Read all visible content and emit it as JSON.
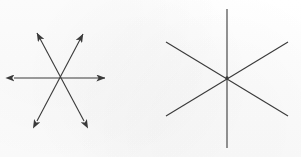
{
  "figure": {
    "background_color": "#fdfdfd",
    "stroke_color": "#3a3a3a",
    "canvas": {
      "width": 301,
      "height": 157
    },
    "panels": [
      {
        "id": "left-panel",
        "name": "vector-star-diagram",
        "description": "Six double-headed arrows radiating from a common center",
        "center": {
          "x": 60,
          "y": 78
        },
        "arrowheads": "both-ends",
        "stroke_width": 1.1,
        "ray_count": 6,
        "line_count": 3,
        "lines": [
          {
            "label": "horizontal-vector",
            "angle_deg": 0,
            "x1": 14,
            "y1": 78,
            "x2": 105,
            "y2": 78
          },
          {
            "label": "diagonal-vector-up-right",
            "angle_deg": 59,
            "x1": 37,
            "y1": 121,
            "x2": 83,
            "y2": 34
          },
          {
            "label": "diagonal-vector-up-left",
            "angle_deg": 121,
            "x1": 84,
            "y1": 121,
            "x2": 37,
            "y2": 33
          }
        ]
      },
      {
        "id": "right-panel",
        "name": "plain-star-diagram",
        "description": "Three plain lines crossing at a common center, no arrowheads",
        "center": {
          "x": 227,
          "y": 78
        },
        "arrowheads": "none",
        "stroke_width": 1.1,
        "ray_count": 6,
        "line_count": 3,
        "center_dot": true,
        "lines": [
          {
            "label": "vertical-line",
            "angle_deg": 90,
            "x1": 227,
            "y1": 9,
            "x2": 227,
            "y2": 148
          },
          {
            "label": "diagonal-line-up-right",
            "angle_deg": 33,
            "x1": 166,
            "y1": 116,
            "x2": 288,
            "y2": 42
          },
          {
            "label": "diagonal-line-down-right",
            "angle_deg": -33,
            "x1": 166,
            "y1": 42,
            "x2": 288,
            "y2": 116
          }
        ]
      }
    ]
  }
}
